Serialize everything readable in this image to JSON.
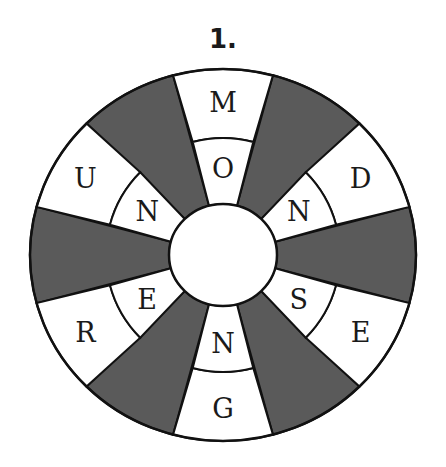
{
  "puzzle": {
    "number_label": "1.",
    "colors": {
      "shaded": "#5a5a5a",
      "white": "#ffffff",
      "line": "#111111"
    },
    "geometry": {
      "cx": 223,
      "cy": 255,
      "outer_rx": 193,
      "outer_ry": 186,
      "middle_r": 117,
      "inner_rx": 54,
      "inner_ry": 51,
      "sector_count": 12,
      "sector_offset_deg": 15
    },
    "white_sectors": [
      {
        "angle_deg": 0,
        "outer_letter": "M",
        "inner_letter": "O"
      },
      {
        "angle_deg": 60,
        "outer_letter": "D",
        "inner_letter": "N"
      },
      {
        "angle_deg": 120,
        "outer_letter": "E",
        "inner_letter": "S"
      },
      {
        "angle_deg": 180,
        "outer_letter": "G",
        "inner_letter": "N"
      },
      {
        "angle_deg": 240,
        "outer_letter": "R",
        "inner_letter": "E"
      },
      {
        "angle_deg": 300,
        "outer_letter": "U",
        "inner_letter": "N"
      }
    ],
    "shaded_sectors_deg": [
      30,
      90,
      150,
      210,
      270,
      330
    ]
  }
}
